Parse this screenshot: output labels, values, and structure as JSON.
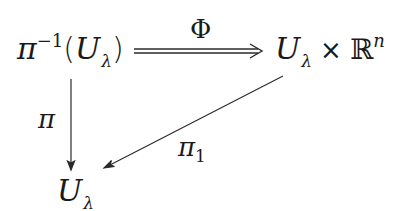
{
  "diagram": {
    "type": "commutative-diagram",
    "nodes": {
      "top_left": {
        "base": "π",
        "superscript": "−1",
        "open_paren": "(",
        "arg": "U",
        "arg_subscript": "λ",
        "close_paren": ")"
      },
      "top_right": {
        "left": "U",
        "left_subscript": "λ",
        "operator": "×",
        "right": "ℝ",
        "right_superscript": "n"
      },
      "bottom": {
        "base": "U",
        "subscript": "λ"
      }
    },
    "arrows": [
      {
        "from": "top_left",
        "to": "top_right",
        "label": "Φ",
        "style": "double"
      },
      {
        "from": "top_left",
        "to": "bottom",
        "label": "π",
        "style": "single"
      },
      {
        "from": "top_right",
        "to": "bottom",
        "label_base": "π",
        "label_subscript": "1",
        "style": "single"
      }
    ]
  }
}
